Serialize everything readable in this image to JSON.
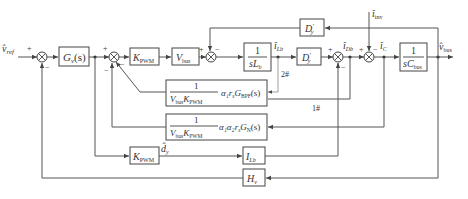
{
  "diagram": {
    "type": "control-block-diagram",
    "inputs": {
      "v_ref": "v̂",
      "v_ref_sub": "ref",
      "i_inv": "î",
      "i_inv_sub": "inv"
    },
    "output": {
      "v_bus": "v̂",
      "v_bus_sub": "bus"
    },
    "blocks": {
      "Gv": {
        "main": "G",
        "sub": "v",
        "tail": "(s)"
      },
      "Kpwm1": {
        "main": "K",
        "sub": "PWM"
      },
      "Vbus": {
        "main": "V",
        "sub": "bus"
      },
      "inductor": {
        "num": "1",
        "den_main": "sL",
        "den_sub": "b"
      },
      "Dy_fwd": {
        "main": "D",
        "sub": "y",
        "prime": "′"
      },
      "Dy_fb": {
        "main": "D",
        "sub": "y",
        "prime": "′"
      },
      "capacitor": {
        "num": "1",
        "den_main": "sC",
        "den_sub": "bus"
      },
      "bpf": {
        "num": "1",
        "den": "V",
        "den_sub1": "bus",
        "den2": "K",
        "den_sub2": "PWM",
        "gain": "α₁r",
        "gain_sub": "s",
        "tf": "G",
        "tf_sub": "BPF",
        "tail": "(s)"
      },
      "notch": {
        "num": "1",
        "den": "V",
        "den_sub1": "bus",
        "den2": "K",
        "den_sub2": "PWM",
        "gain": "α₁α₂r",
        "gain_sub": "s",
        "tf": "G",
        "tf_sub": "N",
        "tail": "(s)"
      },
      "Kpwm2": {
        "main": "K",
        "sub": "PWM"
      },
      "ILb": {
        "main": "I",
        "sub": "Lb"
      },
      "Hv": {
        "main": "H",
        "sub": "v"
      }
    },
    "signals": {
      "iLb": {
        "main": "î",
        "sub": "Lb"
      },
      "iDb": {
        "main": "î",
        "sub": "Db"
      },
      "iC": {
        "main": "î",
        "sub": "C"
      },
      "dy": {
        "main": "d̂",
        "sub": "y"
      }
    },
    "paths": {
      "path2": "2#",
      "path1": "1#"
    },
    "signs": {
      "plus": "+",
      "minus": "−"
    }
  }
}
